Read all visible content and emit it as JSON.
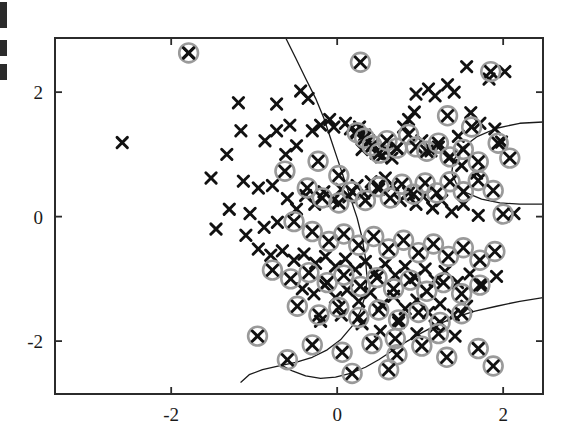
{
  "figure": {
    "kind": "scatter-plot",
    "background_color": "#ffffff",
    "frame_color": "#2b2b2b",
    "marker_color": "#111111",
    "support_ring_color": "#9a9a9a",
    "boundary_color": "#1a1a1a"
  },
  "axes": {
    "x_ticks": [
      "-2",
      "0",
      "2"
    ],
    "y_ticks": [
      "2",
      "0",
      "-2"
    ],
    "x_tick_values": [
      -2,
      0,
      2
    ],
    "y_tick_values": [
      2,
      0,
      -2
    ],
    "xlim": [
      -3.4,
      2.48
    ],
    "ylim": [
      -2.85,
      2.87
    ],
    "xlabel": "",
    "ylabel": "",
    "title": ""
  },
  "left_edge_fragments": [
    {
      "top": 2,
      "height": 26
    },
    {
      "top": 40,
      "height": 16
    },
    {
      "top": 64,
      "height": 16
    }
  ],
  "chart_data": {
    "type": "scatter",
    "title": "",
    "xlabel": "",
    "ylabel": "",
    "xlim": [
      -3.4,
      2.48
    ],
    "ylim": [
      -2.85,
      2.87
    ],
    "grid": false,
    "legend": null,
    "series": [
      {
        "name": "data points",
        "marker": "x",
        "color": "#111111",
        "points": [
          [
            -1.79,
            2.63
          ],
          [
            -2.59,
            1.19
          ],
          [
            -1.19,
            1.83
          ],
          [
            -0.73,
            1.81
          ],
          [
            -0.44,
            2.02
          ],
          [
            -0.35,
            1.9
          ],
          [
            -0.57,
            1.47
          ],
          [
            -1.16,
            1.38
          ],
          [
            -0.73,
            1.38
          ],
          [
            -1.33,
            1.0
          ],
          [
            -0.87,
            1.22
          ],
          [
            -0.49,
            1.14
          ],
          [
            -0.62,
            1.0
          ],
          [
            -0.3,
            1.38
          ],
          [
            -0.2,
            1.47
          ],
          [
            -0.09,
            1.56
          ],
          [
            -0.04,
            1.44
          ],
          [
            0.1,
            1.5
          ],
          [
            0.16,
            1.41
          ],
          [
            0.22,
            1.35
          ],
          [
            0.27,
            1.44
          ],
          [
            0.33,
            1.31
          ],
          [
            0.38,
            1.22
          ],
          [
            0.44,
            1.15
          ],
          [
            0.3,
            1.08
          ],
          [
            0.47,
            1.02
          ],
          [
            0.53,
            0.96
          ],
          [
            0.6,
            1.06
          ],
          [
            0.66,
            0.94
          ],
          [
            0.72,
            1.1
          ],
          [
            0.8,
            1.44
          ],
          [
            0.86,
            1.56
          ],
          [
            0.93,
            1.68
          ],
          [
            1.02,
            1.22
          ],
          [
            1.13,
            1.06
          ],
          [
            1.22,
            1.12
          ],
          [
            0.95,
            1.97
          ],
          [
            1.1,
            2.05
          ],
          [
            1.18,
            1.94
          ],
          [
            1.33,
            2.12
          ],
          [
            1.41,
            2.0
          ],
          [
            1.56,
            2.41
          ],
          [
            1.83,
            2.21
          ],
          [
            2.02,
            2.33
          ],
          [
            1.61,
            1.67
          ],
          [
            1.72,
            1.5
          ],
          [
            1.9,
            1.41
          ],
          [
            1.98,
            1.2
          ],
          [
            1.46,
            1.29
          ],
          [
            1.35,
            0.94
          ],
          [
            1.5,
            0.82
          ],
          [
            1.68,
            0.7
          ],
          [
            2.13,
            0.05
          ],
          [
            -1.52,
            0.62
          ],
          [
            -1.13,
            0.57
          ],
          [
            -0.95,
            0.46
          ],
          [
            -0.78,
            0.5
          ],
          [
            -1.3,
            0.12
          ],
          [
            -1.05,
            0.05
          ],
          [
            -1.46,
            -0.2
          ],
          [
            -1.1,
            -0.3
          ],
          [
            -0.88,
            -0.17
          ],
          [
            -0.72,
            -0.09
          ],
          [
            -0.6,
            0.29
          ],
          [
            -0.49,
            0.12
          ],
          [
            -0.38,
            0.34
          ],
          [
            -0.27,
            0.2
          ],
          [
            -0.16,
            0.4
          ],
          [
            -0.05,
            0.26
          ],
          [
            0.05,
            0.44
          ],
          [
            0.14,
            0.32
          ],
          [
            0.24,
            0.5
          ],
          [
            0.32,
            0.38
          ],
          [
            0.41,
            0.56
          ],
          [
            0.5,
            0.44
          ],
          [
            0.58,
            0.62
          ],
          [
            0.67,
            0.5
          ],
          [
            0.76,
            0.26
          ],
          [
            0.86,
            0.38
          ],
          [
            0.95,
            0.2
          ],
          [
            1.04,
            0.32
          ],
          [
            1.15,
            0.14
          ],
          [
            1.26,
            0.26
          ],
          [
            1.38,
            0.08
          ],
          [
            1.52,
            0.2
          ],
          [
            1.7,
            0.02
          ],
          [
            -0.95,
            -0.52
          ],
          [
            -0.8,
            -0.62
          ],
          [
            -0.66,
            -0.55
          ],
          [
            -0.52,
            -0.7
          ],
          [
            -0.4,
            -0.6
          ],
          [
            -0.26,
            -0.75
          ],
          [
            -0.14,
            -0.64
          ],
          [
            -0.02,
            -0.8
          ],
          [
            0.1,
            -0.68
          ],
          [
            0.22,
            -0.85
          ],
          [
            0.34,
            -0.72
          ],
          [
            0.46,
            -0.9
          ],
          [
            0.58,
            -0.76
          ],
          [
            0.7,
            -0.94
          ],
          [
            0.82,
            -0.8
          ],
          [
            0.94,
            -0.98
          ],
          [
            1.06,
            -0.84
          ],
          [
            1.18,
            -1.02
          ],
          [
            1.3,
            -0.88
          ],
          [
            1.45,
            -1.06
          ],
          [
            1.6,
            -0.92
          ],
          [
            1.75,
            -1.1
          ],
          [
            1.92,
            -0.96
          ],
          [
            -0.42,
            -1.16
          ],
          [
            -0.28,
            -1.24
          ],
          [
            -0.15,
            -1.1
          ],
          [
            -0.02,
            -1.3
          ],
          [
            0.12,
            -1.18
          ],
          [
            0.26,
            -1.36
          ],
          [
            0.4,
            -1.22
          ],
          [
            0.54,
            -1.42
          ],
          [
            0.68,
            -1.28
          ],
          [
            0.82,
            -1.48
          ],
          [
            0.96,
            -1.34
          ],
          [
            1.1,
            -1.54
          ],
          [
            1.24,
            -1.4
          ],
          [
            1.4,
            -1.58
          ],
          [
            1.56,
            -1.44
          ],
          [
            0.3,
            -1.72
          ],
          [
            0.52,
            -1.84
          ],
          [
            0.74,
            -1.7
          ],
          [
            0.96,
            -1.88
          ],
          [
            1.18,
            -1.76
          ],
          [
            1.42,
            -1.92
          ],
          [
            -0.2,
            -1.68
          ],
          [
            0.05,
            -1.58
          ]
        ]
      },
      {
        "name": "support vectors",
        "marker": "x-circled",
        "color": "#111111",
        "ring_color": "#9a9a9a",
        "points": [
          [
            -1.79,
            2.63
          ],
          [
            0.28,
            2.48
          ],
          [
            1.85,
            2.33
          ],
          [
            -0.63,
            0.73
          ],
          [
            -0.23,
            0.89
          ],
          [
            0.02,
            0.66
          ],
          [
            0.24,
            1.35
          ],
          [
            0.33,
            1.26
          ],
          [
            0.42,
            1.14
          ],
          [
            0.51,
            1.02
          ],
          [
            0.6,
            1.22
          ],
          [
            0.72,
            1.1
          ],
          [
            0.86,
            1.32
          ],
          [
            0.95,
            1.12
          ],
          [
            1.08,
            1.05
          ],
          [
            1.22,
            1.18
          ],
          [
            1.36,
            0.96
          ],
          [
            1.52,
            1.08
          ],
          [
            1.7,
            0.88
          ],
          [
            1.94,
            1.18
          ],
          [
            2.08,
            0.94
          ],
          [
            1.33,
            1.62
          ],
          [
            1.62,
            1.44
          ],
          [
            2.0,
            0.04
          ],
          [
            -0.36,
            0.46
          ],
          [
            -0.18,
            0.3
          ],
          [
            0.02,
            0.22
          ],
          [
            0.18,
            0.4
          ],
          [
            0.34,
            0.26
          ],
          [
            0.5,
            0.48
          ],
          [
            0.64,
            0.3
          ],
          [
            0.78,
            0.52
          ],
          [
            0.92,
            0.36
          ],
          [
            1.06,
            0.54
          ],
          [
            1.2,
            0.38
          ],
          [
            1.36,
            0.56
          ],
          [
            1.52,
            0.4
          ],
          [
            1.7,
            0.58
          ],
          [
            1.88,
            0.42
          ],
          [
            -0.52,
            -0.08
          ],
          [
            -0.3,
            -0.24
          ],
          [
            -0.1,
            -0.4
          ],
          [
            0.08,
            -0.28
          ],
          [
            0.26,
            -0.46
          ],
          [
            0.44,
            -0.32
          ],
          [
            0.62,
            -0.52
          ],
          [
            0.8,
            -0.38
          ],
          [
            0.98,
            -0.58
          ],
          [
            1.16,
            -0.44
          ],
          [
            1.34,
            -0.64
          ],
          [
            1.52,
            -0.5
          ],
          [
            1.72,
            -0.7
          ],
          [
            1.9,
            -0.56
          ],
          [
            -0.78,
            -0.86
          ],
          [
            -0.56,
            -1.0
          ],
          [
            -0.34,
            -0.9
          ],
          [
            -0.12,
            -1.06
          ],
          [
            0.08,
            -0.94
          ],
          [
            0.28,
            -1.12
          ],
          [
            0.48,
            -0.98
          ],
          [
            0.68,
            -1.16
          ],
          [
            0.88,
            -1.02
          ],
          [
            1.08,
            -1.2
          ],
          [
            1.28,
            -1.06
          ],
          [
            1.5,
            -1.24
          ],
          [
            1.72,
            -1.1
          ],
          [
            -0.48,
            -1.44
          ],
          [
            -0.22,
            -1.58
          ],
          [
            0.02,
            -1.46
          ],
          [
            0.26,
            -1.62
          ],
          [
            0.5,
            -1.5
          ],
          [
            0.74,
            -1.66
          ],
          [
            0.98,
            -1.54
          ],
          [
            1.24,
            -1.7
          ],
          [
            1.5,
            -1.56
          ],
          [
            -0.96,
            -1.92
          ],
          [
            -0.3,
            -2.06
          ],
          [
            0.06,
            -2.18
          ],
          [
            0.42,
            -2.04
          ],
          [
            0.72,
            -2.22
          ],
          [
            1.02,
            -2.08
          ],
          [
            1.32,
            -2.26
          ],
          [
            1.7,
            -2.12
          ],
          [
            0.18,
            -2.52
          ],
          [
            0.62,
            -2.46
          ],
          [
            1.88,
            -2.4
          ],
          [
            -0.6,
            -2.3
          ],
          [
            0.7,
            -1.96
          ],
          [
            1.22,
            -1.88
          ]
        ]
      }
    ],
    "decision_boundary": {
      "name": "decision boundary",
      "color": "#1a1a1a",
      "paths": [
        [
          [
            -0.62,
            2.87
          ],
          [
            -0.5,
            2.55
          ],
          [
            -0.38,
            2.22
          ],
          [
            -0.26,
            1.9
          ],
          [
            -0.16,
            1.58
          ],
          [
            -0.08,
            1.26
          ],
          [
            0.0,
            0.94
          ],
          [
            0.08,
            0.62
          ],
          [
            0.16,
            0.3
          ],
          [
            0.24,
            -0.02
          ],
          [
            0.3,
            -0.34
          ],
          [
            0.34,
            -0.66
          ],
          [
            0.36,
            -0.98
          ],
          [
            0.34,
            -1.26
          ],
          [
            0.28,
            -1.52
          ],
          [
            0.18,
            -1.76
          ],
          [
            0.04,
            -1.98
          ],
          [
            -0.12,
            -2.14
          ],
          [
            -0.3,
            -2.26
          ],
          [
            -0.5,
            -2.34
          ],
          [
            -0.7,
            -2.4
          ],
          [
            -0.9,
            -2.46
          ],
          [
            -1.06,
            -2.54
          ],
          [
            -1.16,
            -2.66
          ]
        ],
        [
          [
            2.48,
            -1.3
          ],
          [
            2.2,
            -1.36
          ],
          [
            1.92,
            -1.44
          ],
          [
            1.66,
            -1.52
          ],
          [
            1.42,
            -1.62
          ],
          [
            1.2,
            -1.74
          ],
          [
            1.0,
            -1.88
          ],
          [
            0.82,
            -2.02
          ],
          [
            0.66,
            -2.16
          ],
          [
            0.5,
            -2.3
          ],
          [
            0.34,
            -2.42
          ],
          [
            0.16,
            -2.52
          ],
          [
            -0.02,
            -2.58
          ],
          [
            -0.2,
            -2.6
          ],
          [
            -0.38,
            -2.56
          ],
          [
            -0.54,
            -2.48
          ],
          [
            -0.68,
            -2.38
          ]
        ],
        [
          [
            2.48,
            1.52
          ],
          [
            2.2,
            1.5
          ],
          [
            1.92,
            1.42
          ],
          [
            1.68,
            1.28
          ],
          [
            1.5,
            1.1
          ],
          [
            1.4,
            0.9
          ],
          [
            1.38,
            0.7
          ],
          [
            1.44,
            0.52
          ],
          [
            1.56,
            0.38
          ],
          [
            1.74,
            0.28
          ],
          [
            1.96,
            0.22
          ],
          [
            2.2,
            0.2
          ],
          [
            2.48,
            0.2
          ]
        ]
      ]
    }
  }
}
